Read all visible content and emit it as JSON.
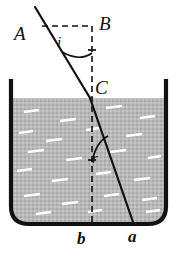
{
  "figure": {
    "type": "optics-ray-diagram",
    "labels": {
      "A": "A",
      "B": "B",
      "C": "C",
      "angle_incidence": "i",
      "angle_refraction": "r",
      "point_b": "b",
      "point_a": "a"
    },
    "colors": {
      "ink": "#111111",
      "water_fill": "#b5b5b5",
      "background": "#ffffff",
      "vessel_stroke": "#111111"
    },
    "geometry": {
      "incident_ray": {
        "x1": 35,
        "y1": 7,
        "x2": 90,
        "y2": 98
      },
      "refracted_ray": {
        "x1": 90,
        "y1": 98,
        "x2": 133,
        "y2": 222
      },
      "normal_dashed": {
        "x": 92,
        "y1": 26,
        "y2": 224
      },
      "horizontal_dashed": {
        "y": 26,
        "x1": 42,
        "x2": 92
      },
      "water_surface_y": 98,
      "vessel_left_x": 11,
      "vessel_right_x": 166,
      "vessel_top_y": 79,
      "vessel_bottom_y": 224
    }
  }
}
